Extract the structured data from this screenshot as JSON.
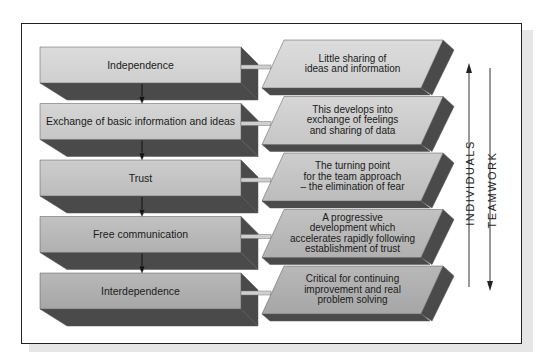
{
  "diagram": {
    "type": "stage-progression",
    "stages": [
      {
        "label": "Independence",
        "description": "Little sharing of\nideas and information"
      },
      {
        "label": "Exchange of basic information and ideas",
        "description": "This develops into\nexchange of feelings\nand sharing of data"
      },
      {
        "label": "Trust",
        "description": "The turning point\nfor the team approach\n– the elimination of fear"
      },
      {
        "label": "Free communication",
        "description": "A progressive\ndevelopment which\naccelerates rapidly following\nestablishment of trust"
      },
      {
        "label": "Interdependence",
        "description": "Critical for continuing\nimprovement and real\nproblem solving"
      }
    ],
    "axis_up_label": "INDIVIDUALS",
    "axis_down_label": "TEAMWORK"
  },
  "colors": {
    "face_top": "#d8d8d8",
    "face_bottom": "#a9a9a9",
    "shadow_face": "#4a4a4a",
    "frame_border": "#222222"
  }
}
